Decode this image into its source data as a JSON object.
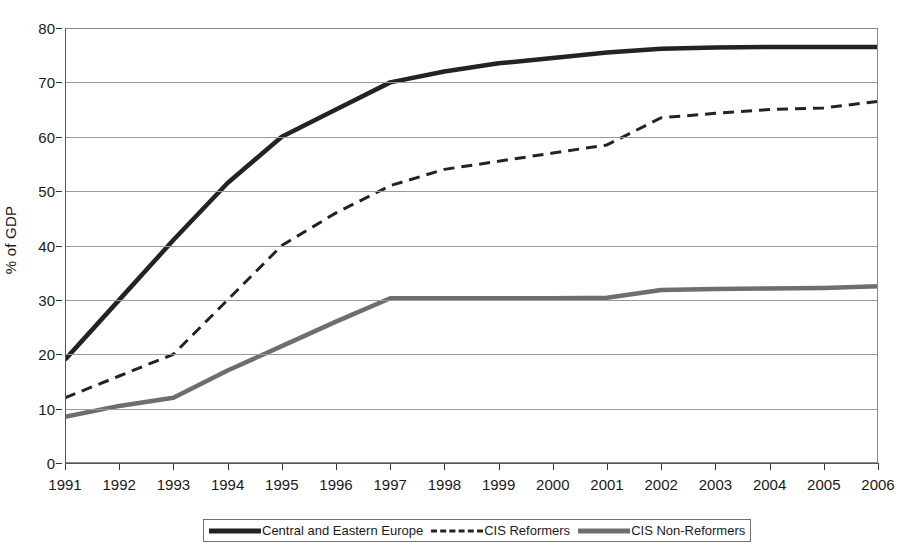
{
  "chart_data": {
    "type": "line",
    "title": "",
    "xlabel": "",
    "ylabel": "% of GDP",
    "ylim": [
      0,
      80
    ],
    "ytick_step": 10,
    "grid": true,
    "legend_position": "bottom",
    "categories": [
      "1991",
      "1992",
      "1993",
      "1994",
      "1995",
      "1996",
      "1997",
      "1998",
      "1999",
      "2000",
      "2001",
      "2002",
      "2003",
      "2004",
      "2005",
      "2006"
    ],
    "yticks": [
      "0",
      "10",
      "20",
      "30",
      "40",
      "50",
      "60",
      "70",
      "80"
    ],
    "series": [
      {
        "name": "Central and Eastern Europe",
        "style": "solid",
        "color": "#232323",
        "width": 4.5,
        "values": [
          19.0,
          30.0,
          41.0,
          51.5,
          60.0,
          65.0,
          70.0,
          72.0,
          73.5,
          74.5,
          75.5,
          76.2,
          76.4,
          76.5,
          76.5,
          76.5
        ]
      },
      {
        "name": "CIS Reformers",
        "style": "dashed",
        "color": "#232323",
        "width": 3,
        "values": [
          12.0,
          16.0,
          20.0,
          30.0,
          40.0,
          46.0,
          51.0,
          54.0,
          55.5,
          57.0,
          58.5,
          63.5,
          64.3,
          65.0,
          65.3,
          66.5
        ]
      },
      {
        "name": "CIS Non-Reformers",
        "style": "solid",
        "color": "#6e6e6e",
        "width": 4.5,
        "values": [
          8.5,
          10.5,
          12.0,
          17.0,
          21.5,
          26.0,
          30.3,
          30.3,
          30.3,
          30.3,
          30.4,
          31.8,
          32.0,
          32.1,
          32.2,
          32.5
        ]
      }
    ]
  },
  "legend": {
    "items": [
      {
        "label": "Central and Eastern Europe",
        "swatch": "solid-dark-line-icon"
      },
      {
        "label": "CIS Reformers",
        "swatch": "dashed-line-icon"
      },
      {
        "label": "CIS Non-Reformers",
        "swatch": "solid-gray-line-icon"
      }
    ]
  }
}
